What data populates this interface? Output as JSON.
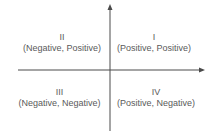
{
  "diagram": {
    "type": "coordinate-plane-quadrants",
    "axis_color": "#4a4a4a",
    "quadrants": [
      {
        "numeral": "II",
        "signs": "(Negative, Positive)"
      },
      {
        "numeral": "I",
        "signs": "(Positive, Positive)"
      },
      {
        "numeral": "III",
        "signs": "(Negative, Negative)"
      },
      {
        "numeral": "IV",
        "signs": "(Positive, Negative)"
      }
    ]
  }
}
